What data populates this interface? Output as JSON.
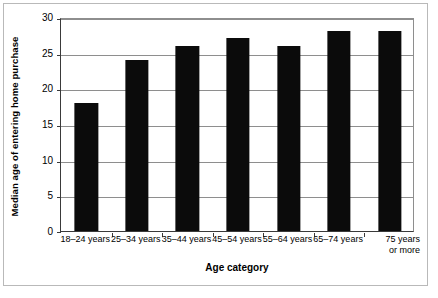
{
  "chart_data": {
    "type": "bar",
    "title": "",
    "xlabel": "Age category",
    "ylabel": "Median age of entering home purchase",
    "categories": [
      "18–24 years",
      "25–34 years",
      "35–44 years",
      "45–54 years",
      "55–64 years",
      "65–74 years",
      "75 years\nor more"
    ],
    "values": [
      18,
      24,
      26,
      27,
      26,
      28,
      28
    ],
    "ylim": [
      0,
      30
    ],
    "ytick_labels": [
      "0",
      "5",
      "10",
      "15",
      "20",
      "25",
      "30"
    ],
    "ytick_values": [
      0,
      5,
      10,
      15,
      20,
      25,
      30
    ],
    "grid": "horizontal",
    "legend": "none",
    "bar_color": "#0b0b0b",
    "grid_color": "#8e8e8e",
    "axis_color": "#3a3a3a",
    "border_color": "#b9b9b9"
  }
}
